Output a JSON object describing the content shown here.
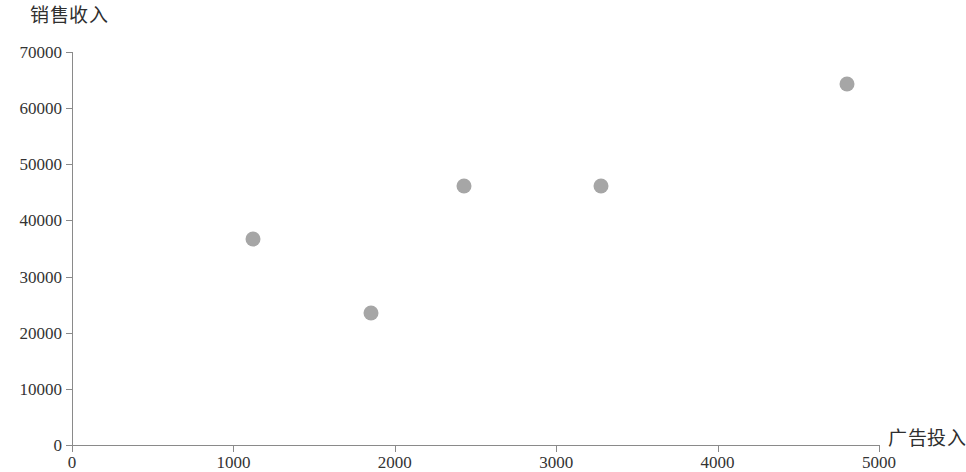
{
  "chart_data": {
    "type": "scatter",
    "title": "",
    "xlabel": "广告投入",
    "ylabel": "销售收入",
    "xlim": [
      0,
      5000
    ],
    "ylim": [
      0,
      70000
    ],
    "grid": false,
    "legend": null,
    "marker_color": "#a6a6a6",
    "axis_color": "#8a8a8a",
    "x_ticks": [
      "0",
      "1000",
      "2000",
      "3000",
      "4000",
      "5000"
    ],
    "x_tick_values": [
      0,
      1000,
      2000,
      3000,
      4000,
      5000
    ],
    "y_ticks": [
      "0",
      "10000",
      "20000",
      "30000",
      "40000",
      "50000",
      "60000",
      "70000"
    ],
    "y_tick_values": [
      0,
      10000,
      20000,
      30000,
      40000,
      50000,
      60000,
      70000
    ],
    "points": [
      {
        "x": 1120,
        "y": 36700
      },
      {
        "x": 1850,
        "y": 23600
      },
      {
        "x": 2430,
        "y": 46200
      },
      {
        "x": 3280,
        "y": 46200
      },
      {
        "x": 4800,
        "y": 64300
      }
    ],
    "x": [
      1120,
      1850,
      2430,
      3280,
      4800
    ],
    "values": [
      36700,
      23600,
      46200,
      46200,
      64300
    ]
  }
}
